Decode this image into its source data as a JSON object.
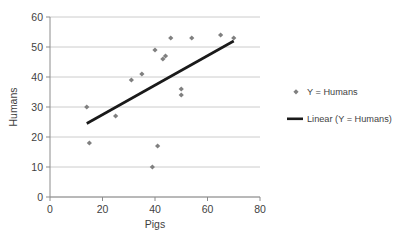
{
  "chart_data": {
    "type": "scatter",
    "title": "",
    "xlabel": "Pigs",
    "ylabel": "Humans",
    "xlim": [
      0,
      80
    ],
    "ylim": [
      0,
      60
    ],
    "xticks": [
      0,
      20,
      40,
      60,
      80
    ],
    "yticks": [
      0,
      10,
      20,
      30,
      40,
      50,
      60
    ],
    "grid": "horizontal",
    "legend_position": "right",
    "series": [
      {
        "name": "Y = Humans",
        "type": "scatter",
        "marker": "diamond",
        "color": "#808080",
        "points": [
          {
            "x": 14,
            "y": 30
          },
          {
            "x": 15,
            "y": 18
          },
          {
            "x": 25,
            "y": 27
          },
          {
            "x": 31,
            "y": 39
          },
          {
            "x": 35,
            "y": 41
          },
          {
            "x": 39,
            "y": 10
          },
          {
            "x": 40,
            "y": 49
          },
          {
            "x": 41,
            "y": 17
          },
          {
            "x": 43,
            "y": 46
          },
          {
            "x": 44,
            "y": 47
          },
          {
            "x": 46,
            "y": 53
          },
          {
            "x": 50,
            "y": 34
          },
          {
            "x": 50,
            "y": 36
          },
          {
            "x": 54,
            "y": 53
          },
          {
            "x": 65,
            "y": 54
          },
          {
            "x": 70,
            "y": 53
          }
        ]
      },
      {
        "name": "Linear (Y = Humans)",
        "type": "line",
        "color": "#1a1a1a",
        "endpoints": [
          {
            "x": 14,
            "y": 24.5
          },
          {
            "x": 70,
            "y": 52
          }
        ]
      }
    ],
    "legend": [
      {
        "label": "Y = Humans",
        "marker": "diamond",
        "color": "#808080"
      },
      {
        "label": "Linear (Y = Humans)",
        "marker": "line",
        "color": "#1a1a1a"
      }
    ]
  },
  "axes": {
    "x_tick_labels": [
      "0",
      "20",
      "40",
      "60",
      "80"
    ],
    "y_tick_labels": [
      "0",
      "10",
      "20",
      "30",
      "40",
      "50",
      "60"
    ],
    "x_title": "Pigs",
    "y_title": "Humans"
  }
}
